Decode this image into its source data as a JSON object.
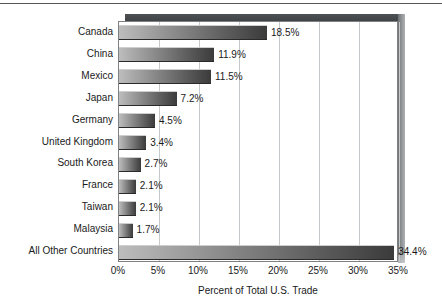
{
  "chart_data": {
    "type": "bar",
    "orientation": "horizontal",
    "title": "",
    "xlabel": "Percent of Total U.S. Trade",
    "ylabel": "",
    "xlim": [
      0,
      35
    ],
    "xticks": [
      "0%",
      "5%",
      "10%",
      "15%",
      "20%",
      "25%",
      "30%",
      "35%"
    ],
    "xtick_values": [
      0,
      5,
      10,
      15,
      20,
      25,
      30,
      35
    ],
    "grid": "vertical",
    "legend": null,
    "categories": [
      "Canada",
      "China",
      "Mexico",
      "Japan",
      "Germany",
      "United Kingdom",
      "South Korea",
      "France",
      "Taiwan",
      "Malaysia",
      "All Other Countries"
    ],
    "values": [
      18.5,
      11.9,
      11.5,
      7.2,
      4.5,
      3.4,
      2.7,
      2.1,
      2.1,
      1.7,
      34.4
    ],
    "value_labels": [
      "18.5%",
      "11.9%",
      "11.5%",
      "7.2%",
      "4.5%",
      "3.4%",
      "2.7%",
      "2.1%",
      "2.1%",
      "1.7%",
      "34.4%"
    ],
    "colors": {
      "bar_gradient_start": "#bdbdbd",
      "bar_gradient_end": "#3b3b3b",
      "gridline": "#c6cacd",
      "plot_border": "#7d8184",
      "slab_top": "#45484b",
      "slab_right": "#9a9ea1",
      "text": "#1a1a1a",
      "background": "#ffffff"
    }
  }
}
